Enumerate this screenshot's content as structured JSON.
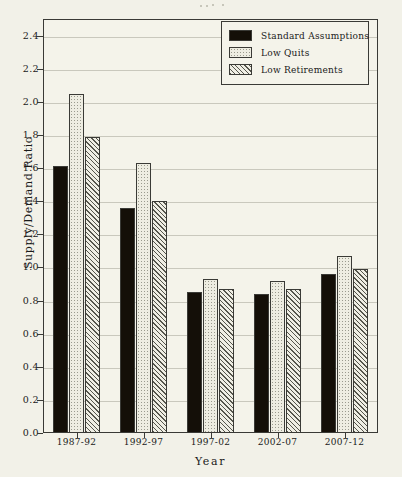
{
  "chart_data": {
    "type": "bar",
    "title": "",
    "xlabel": "Year",
    "ylabel": "Supply/Demand Ratio",
    "categories": [
      "1987-92",
      "1992-97",
      "1997-02",
      "2002-07",
      "2007-12"
    ],
    "series": [
      {
        "name": "Standard Assumptions",
        "pattern": "solid-black",
        "values": [
          1.61,
          1.36,
          0.85,
          0.84,
          0.96
        ]
      },
      {
        "name": "Low Quits",
        "pattern": "light-dotted",
        "values": [
          2.05,
          1.63,
          0.93,
          0.92,
          1.07
        ]
      },
      {
        "name": "Low Retirements",
        "pattern": "diagonal-hatch",
        "values": [
          1.79,
          1.4,
          0.87,
          0.87,
          0.99
        ]
      }
    ],
    "ylim": [
      0.0,
      2.5
    ],
    "ytick_values": [
      0.0,
      0.2,
      0.4,
      0.6,
      0.8,
      1.0,
      1.2,
      1.4,
      1.6,
      1.8,
      2.0,
      2.2,
      2.4
    ],
    "ytick_labels": [
      "0.0",
      "0.2",
      "0.4",
      "0.6",
      "0.8",
      "1.0",
      "1.2",
      "1.4",
      "1.6",
      "1.8",
      "2.0",
      "2.2",
      "2.4"
    ],
    "grid": true,
    "legend_position": "top-right",
    "colors": {
      "background": "#f2f1e8",
      "plot_background": "#f4f3ea",
      "axis": "#3a3a36",
      "gridline": "#c9c8bd",
      "series_standard": "#140f08",
      "series_low_quits": "#eeede2",
      "series_low_retirements": "#efeee4"
    }
  },
  "legend": {
    "entries": [
      {
        "label": "Standard Assumptions"
      },
      {
        "label": "Low Quits"
      },
      {
        "label": "Low Retirements"
      }
    ]
  }
}
